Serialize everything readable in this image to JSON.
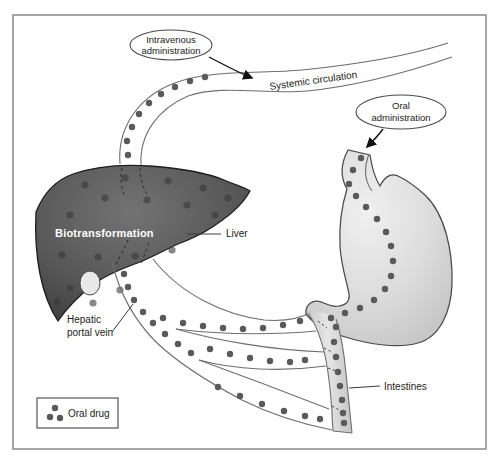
{
  "labels": {
    "intravenous": {
      "line1": "Intravenous",
      "line2": "administration"
    },
    "systemic": "Systemic circulation",
    "oral": {
      "line1": "Oral",
      "line2": "administration"
    },
    "biotransformation": "Biotransformation",
    "liver": "Liver",
    "hepatic": {
      "line1": "Hepatic",
      "line2": "portal vein"
    },
    "intestines": "Intestines"
  },
  "legend": {
    "label": "Oral drug"
  },
  "colors": {
    "liver": "#4f4f4f",
    "stomach": "#d9d9d9",
    "drug_dot": "#5a5a5a",
    "vessel_outline": "#6f6f6f",
    "frame": "#909090",
    "text": "#1c1c1c"
  }
}
